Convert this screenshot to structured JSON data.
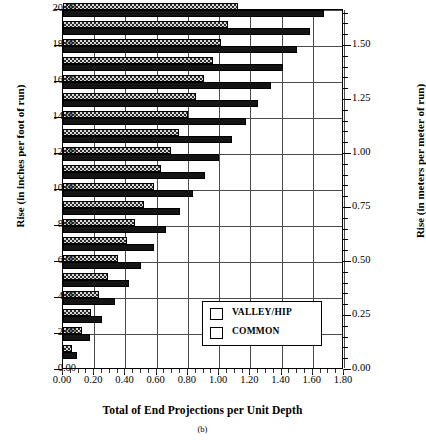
{
  "chart_data": {
    "type": "bar",
    "orientation": "horizontal",
    "title": "",
    "caption": "(b)",
    "xlabel": "Total of End Projections per Unit Depth",
    "ylabel": "Rise (in inches per foot of run)",
    "ylabel_right": "Rise (in meters per meter of run)",
    "xlim": [
      0.0,
      1.8
    ],
    "ylim": [
      0.0,
      20.0
    ],
    "ylim_right": [
      0.0,
      1.6667
    ],
    "xticks": [
      "0.00",
      "0.20",
      "0.40",
      "0.60",
      "0.80",
      "1.00",
      "1.20",
      "1.40",
      "1.60",
      "1.80"
    ],
    "xtick_values": [
      0.0,
      0.2,
      0.4,
      0.6,
      0.8,
      1.0,
      1.2,
      1.4,
      1.6,
      1.8
    ],
    "yticks": [
      "0.00",
      "2.00",
      "4.00",
      "6.00",
      "8.00",
      "10.00",
      "12.00",
      "14.00",
      "16.00",
      "18.00",
      "20.00"
    ],
    "ytick_values": [
      0,
      2,
      4,
      6,
      8,
      10,
      12,
      14,
      16,
      18,
      20
    ],
    "yticks_right": [
      "0.00",
      "0.25",
      "0.50",
      "0.75",
      "1.00",
      "1.25",
      "1.50"
    ],
    "ytick_right_values": [
      0.0,
      0.25,
      0.5,
      0.75,
      1.0,
      1.25,
      1.5
    ],
    "grid": true,
    "legend_position": "lower right",
    "categories": [
      1,
      2,
      3,
      4,
      5,
      6,
      7,
      8,
      9,
      10,
      11,
      12,
      13,
      14,
      15,
      16,
      17,
      18,
      19,
      20
    ],
    "series": [
      {
        "name": "VALLEY/HIP",
        "pattern": "checkered",
        "color": "#d8d8d8",
        "values": [
          0.06,
          0.12,
          0.18,
          0.23,
          0.29,
          0.35,
          0.41,
          0.46,
          0.52,
          0.58,
          0.63,
          0.69,
          0.74,
          0.8,
          0.85,
          0.9,
          0.96,
          1.01,
          1.06,
          1.12
        ]
      },
      {
        "name": "COMMON",
        "pattern": "solid",
        "color": "#141414",
        "values": [
          0.09,
          0.17,
          0.25,
          0.33,
          0.42,
          0.5,
          0.58,
          0.66,
          0.75,
          0.83,
          0.91,
          1.0,
          1.08,
          1.17,
          1.25,
          1.33,
          1.41,
          1.5,
          1.58,
          1.67
        ]
      }
    ]
  },
  "legend": {
    "entries": [
      {
        "label": "VALLEY/HIP",
        "swatch": "checkered-swatch"
      },
      {
        "label": "COMMON",
        "swatch": "solid-swatch"
      }
    ]
  }
}
